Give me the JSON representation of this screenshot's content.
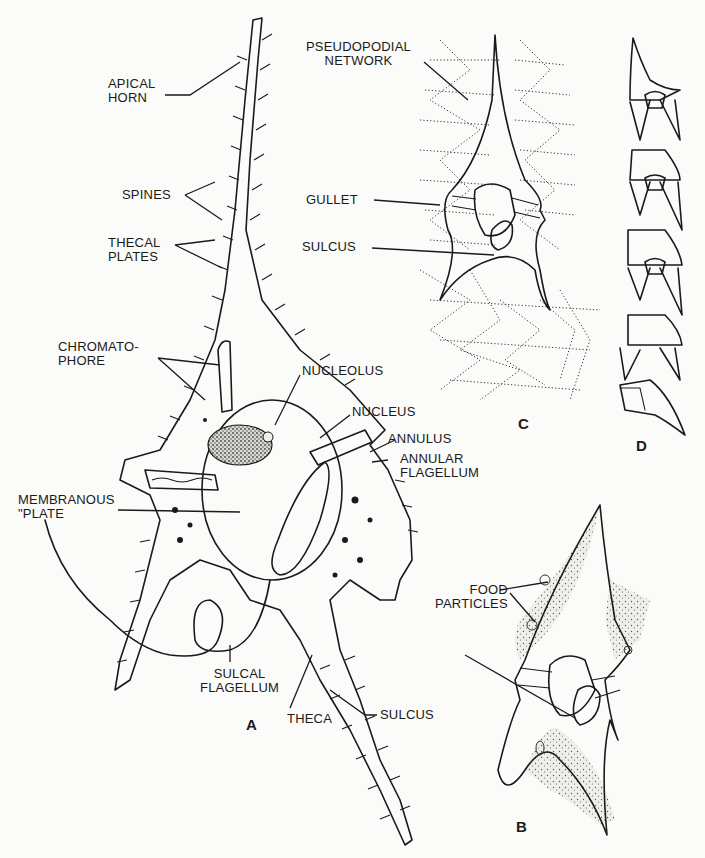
{
  "figure": {
    "panels": [
      {
        "id": "A",
        "label": "A"
      },
      {
        "id": "B",
        "label": "B"
      },
      {
        "id": "C",
        "label": "C"
      },
      {
        "id": "D",
        "label": "D"
      }
    ]
  },
  "labels_a": {
    "apical_horn": "APICAL\nHORN",
    "spines": "SPINES",
    "thecal_plates": "THECAL\nPLATES",
    "chromatophore": "CHROMATO-\nPHORE",
    "nucleolus": "NUCLEOLUS",
    "nucleus": "NUCLEUS",
    "annulus": "ANNULUS",
    "annular_flagellum": "ANNULAR\nFLAGELLUM",
    "membranous_plate": "MEMBRANOUS\n\"PLATE",
    "sulcal_flagellum": "SULCAL\nFLAGELLUM",
    "theca": "THECA",
    "sulcus": "SULCUS"
  },
  "labels_b": {
    "food_particles": "FOOD\nPARTICLES"
  },
  "labels_c": {
    "pseudopodial_network": "PSEUDOPODIAL\nNETWORK",
    "gullet": "GULLET",
    "sulcus": "SULCUS"
  },
  "colors": {
    "ink": "#1a1a1a",
    "paper": "#fbfbf9",
    "stipple": "#e9e9e4",
    "nucleolus_fill": "#2b2b2b"
  }
}
